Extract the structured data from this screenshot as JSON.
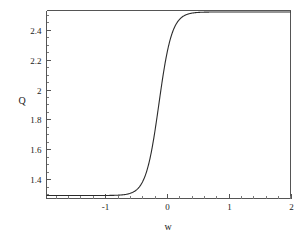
{
  "chart_data": {
    "type": "line",
    "title": "",
    "xlabel": "w",
    "ylabel": "Q",
    "xlim": [
      -1.95,
      2.0
    ],
    "ylim": [
      1.27,
      2.53
    ],
    "grid": false,
    "legend": null,
    "x_ticks": [
      -1,
      0,
      1,
      2
    ],
    "x_tick_labels": [
      "-1",
      "0",
      "1",
      "2"
    ],
    "x_minor_step": 0.2,
    "y_ticks": [
      1.4,
      1.6,
      1.8,
      2.0,
      2.2,
      2.4
    ],
    "y_tick_labels": [
      "1.4",
      "1.6",
      "1.8",
      "2",
      "2.2",
      "2.4"
    ],
    "y_minor_step": 0.05,
    "series": [
      {
        "name": "Q(w)",
        "color": "#2b2b2b",
        "description": "sigmoid transition from lower plateau to upper plateau",
        "lower_asymptote": 1.29,
        "upper_asymptote": 2.52,
        "midpoint_w": -0.13,
        "steepness": 9.5,
        "x": [
          -1.95,
          -1.8,
          -1.6,
          -1.4,
          -1.2,
          -1.0,
          -0.9,
          -0.8,
          -0.7,
          -0.6,
          -0.55,
          -0.5,
          -0.45,
          -0.4,
          -0.35,
          -0.3,
          -0.25,
          -0.2,
          -0.15,
          -0.13,
          -0.1,
          -0.05,
          0.0,
          0.05,
          0.1,
          0.15,
          0.2,
          0.25,
          0.3,
          0.35,
          0.4,
          0.5,
          0.6,
          0.7,
          0.8,
          1.0,
          1.2,
          1.4,
          1.6,
          1.8,
          2.0
        ],
        "y": [
          1.29,
          1.29,
          1.29,
          1.291,
          1.291,
          1.293,
          1.295,
          1.298,
          1.302,
          1.31,
          1.316,
          1.325,
          1.337,
          1.355,
          1.382,
          1.421,
          1.477,
          1.556,
          1.66,
          1.709,
          1.786,
          1.918,
          2.046,
          2.16,
          2.255,
          2.329,
          2.384,
          2.424,
          2.452,
          2.471,
          2.484,
          2.5,
          2.509,
          2.514,
          2.517,
          2.519,
          2.52,
          2.52,
          2.52,
          2.52,
          2.52
        ]
      }
    ]
  },
  "axes": {
    "y_axis_title": "Q",
    "x_axis_title": "w"
  }
}
